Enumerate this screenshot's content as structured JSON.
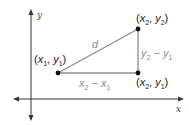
{
  "axes": {
    "x_label": "x",
    "y_label": "y"
  },
  "points": {
    "p1": {
      "label": "(x1, y1)",
      "parts": [
        "(",
        "x",
        "1",
        ", ",
        "y",
        "1",
        ")"
      ]
    },
    "p2": {
      "label": "(x2, y2)",
      "parts": [
        "(",
        "x",
        "2",
        ", ",
        "y",
        "2",
        ")"
      ]
    },
    "p3": {
      "label": "(x2, y1)",
      "parts": [
        "(",
        "x",
        "2",
        ", ",
        "y",
        "1",
        ")"
      ]
    }
  },
  "segments": {
    "hypotenuse": {
      "label": "d"
    },
    "horizontal": {
      "label": "x2 − x1",
      "a": "x",
      "a_sub": "2",
      "op": " − ",
      "b": "x",
      "b_sub": "1"
    },
    "vertical": {
      "label": "y2 − y1",
      "a": "y",
      "a_sub": "2",
      "op": " − ",
      "b": "y",
      "b_sub": "1"
    }
  },
  "colors": {
    "axis": "#222222",
    "segment": "#8c8c8c",
    "point": "#111111",
    "gray_text": "#8a8a8a"
  }
}
